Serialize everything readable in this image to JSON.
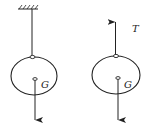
{
  "diagram": {
    "left_figure": {
      "description": "Ball hanging from ceiling by rope",
      "gravity_label": "G"
    },
    "right_figure": {
      "description": "Free-body diagram of ball",
      "tension_label": "T",
      "gravity_label": "G"
    },
    "colors": {
      "stroke": "#222222",
      "background": "#ffffff"
    }
  }
}
